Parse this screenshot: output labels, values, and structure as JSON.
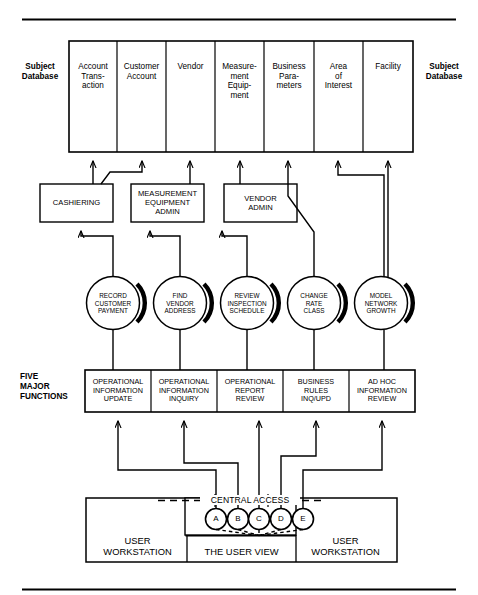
{
  "figure": {
    "rule_color": "#000000"
  },
  "left_labels": {
    "subject_database": "Subject\nDatabase",
    "five_major_functions": "FIVE\nMAJOR\nFUNCTIONS"
  },
  "right_labels": {
    "subject_database": "Subject\nDatabase"
  },
  "subject_databases": {
    "label_left": "Subject Database",
    "label_right": "Subject Database",
    "columns": [
      {
        "id": "account-transaction",
        "lines": [
          "Account",
          "Trans-",
          "action"
        ]
      },
      {
        "id": "customer-account",
        "lines": [
          "Customer",
          "Account"
        ]
      },
      {
        "id": "vendor",
        "lines": [
          "Vendor"
        ]
      },
      {
        "id": "measurement-equipment",
        "lines": [
          "Measure-",
          "ment",
          "Equip-",
          "ment"
        ]
      },
      {
        "id": "business-parameters",
        "lines": [
          "Business",
          "Para-",
          "meters"
        ]
      },
      {
        "id": "area-of-interest",
        "lines": [
          "Area",
          "of",
          "Interest"
        ]
      },
      {
        "id": "facility",
        "lines": [
          "Facility"
        ]
      }
    ]
  },
  "applications": [
    {
      "id": "cashiering",
      "lines": [
        "CASHIERING"
      ]
    },
    {
      "id": "measurement-equipment-admin",
      "lines": [
        "MEASUREMENT",
        "EQUIPMENT",
        "ADMIN"
      ]
    },
    {
      "id": "vendor-admin",
      "lines": [
        "VENDOR",
        "ADMIN"
      ]
    }
  ],
  "transactions": [
    {
      "id": "record-customer-payment",
      "lines": [
        "RECORD",
        "CUSTOMER",
        "PAYMENT"
      ]
    },
    {
      "id": "find-vendor-address",
      "lines": [
        "FIND",
        "VENDOR",
        "ADDRESS"
      ]
    },
    {
      "id": "review-inspection-schedule",
      "lines": [
        "REVIEW",
        "INSPECTION",
        "SCHEDULE"
      ]
    },
    {
      "id": "change-rate-class",
      "lines": [
        "CHANGE",
        "RATE",
        "CLASS"
      ]
    },
    {
      "id": "model-network-growth",
      "lines": [
        "MODEL",
        "NETWORK",
        "GROWTH"
      ]
    }
  ],
  "major_functions": [
    {
      "id": "operational-information-update",
      "lines": [
        "OPERATIONAL",
        "INFORMATION",
        "UPDATE"
      ]
    },
    {
      "id": "operational-information-inquiry",
      "lines": [
        "OPERATIONAL",
        "INFORMATION",
        "INQUIRY"
      ]
    },
    {
      "id": "operational-report-review",
      "lines": [
        "OPERATIONAL",
        "REPORT",
        "REVIEW"
      ]
    },
    {
      "id": "business-rules-inq-upd",
      "lines": [
        "BUSINESS",
        "RULES",
        "INQ/UPD"
      ]
    },
    {
      "id": "ad-hoc-information-review",
      "lines": [
        "AD HOC",
        "INFORMATION",
        "REVIEW"
      ]
    }
  ],
  "central_access": {
    "label": "CENTRAL ACCESS",
    "nodes": [
      "A",
      "B",
      "C",
      "D",
      "E"
    ]
  },
  "bottom_zones": [
    {
      "id": "user-workstation-left",
      "lines": [
        "USER",
        "WORKSTATION"
      ]
    },
    {
      "id": "the-user-view",
      "lines": [
        "THE USER VIEW"
      ]
    },
    {
      "id": "user-workstation-right",
      "lines": [
        "USER",
        "WORKSTATION"
      ]
    }
  ]
}
